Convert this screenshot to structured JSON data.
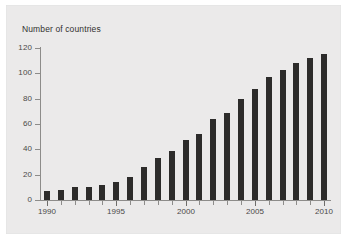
{
  "chart_data": {
    "type": "bar",
    "title": "Number of countries",
    "xlabel": "",
    "ylabel": "",
    "categories": [
      "1990",
      "1991",
      "1992",
      "1993",
      "1994",
      "1995",
      "1996",
      "1997",
      "1998",
      "1999",
      "2000",
      "2001",
      "2002",
      "2003",
      "2004",
      "2005",
      "2006",
      "2007",
      "2008",
      "2009",
      "2010"
    ],
    "values": [
      7,
      8,
      10,
      10,
      12,
      14,
      18,
      26,
      33,
      39,
      47,
      52,
      64,
      69,
      80,
      88,
      97,
      103,
      108,
      112,
      115
    ],
    "ylim": [
      0,
      120
    ],
    "yticks": [
      "0",
      "20",
      "40",
      "60",
      "80",
      "100",
      "120"
    ],
    "ytick_values": [
      0,
      20,
      40,
      60,
      80,
      100,
      120
    ],
    "xticks": [
      "1990",
      "1995",
      "2000",
      "2005",
      "2010"
    ],
    "xtick_values": [
      1990,
      1995,
      2000,
      2005,
      2010
    ],
    "grid": false,
    "legend": null,
    "bar_color": "#2d2c2b",
    "panel_color": "#ebeaea",
    "axis_color": "#8d8c8a"
  }
}
